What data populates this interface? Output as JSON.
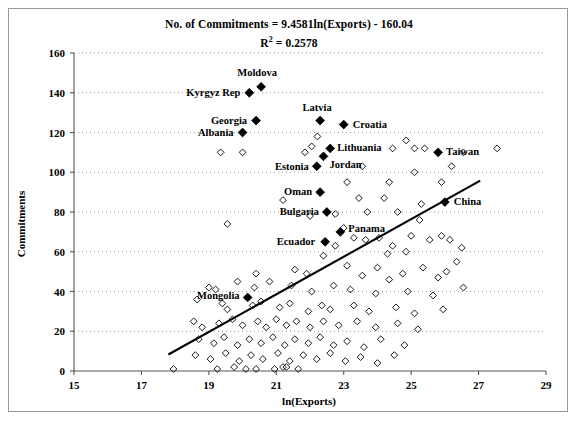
{
  "chart_data": {
    "type": "scatter",
    "title": "No. of Commitments = 9.4581ln(Exports) - 160.04",
    "subtitle_prefix": "R",
    "subtitle_sup": "2",
    "subtitle_rest": " = 0.2578",
    "xlabel": "ln(Exports)",
    "ylabel": "Commitments",
    "xlim": [
      15,
      29
    ],
    "ylim": [
      0,
      160
    ],
    "xticks": [
      15,
      17,
      19,
      21,
      23,
      25,
      27,
      29
    ],
    "yticks": [
      0,
      20,
      40,
      60,
      80,
      100,
      120,
      140,
      160
    ],
    "grid": "horizontal-dotted",
    "legend": "none",
    "regression": {
      "slope": 9.4581,
      "intercept": -160.04,
      "r_squared": 0.2578,
      "x_start": 17.8,
      "x_end": 27.05
    },
    "labeled_points": [
      {
        "label": "Moldova",
        "x": 20.55,
        "y": 143,
        "label_dx": -4,
        "label_dy": -11,
        "anchor": "middle"
      },
      {
        "label": "Kyrgyz Rep",
        "x": 20.2,
        "y": 140,
        "label_dx": -9,
        "label_dy": 3,
        "anchor": "end"
      },
      {
        "label": "Georgia",
        "x": 20.4,
        "y": 126,
        "label_dx": -9,
        "label_dy": 3,
        "anchor": "end"
      },
      {
        "label": "Latvia",
        "x": 22.3,
        "y": 126,
        "label_dx": -3,
        "label_dy": -10,
        "anchor": "middle"
      },
      {
        "label": "Croatia",
        "x": 23.0,
        "y": 124,
        "label_dx": 9,
        "label_dy": 3,
        "anchor": "start"
      },
      {
        "label": "Albania",
        "x": 20.0,
        "y": 120,
        "label_dx": -9,
        "label_dy": 3,
        "anchor": "end"
      },
      {
        "label": "Lithuania",
        "x": 22.6,
        "y": 112,
        "label_dx": 7,
        "label_dy": 3,
        "anchor": "start"
      },
      {
        "label": "Taiwan",
        "x": 25.8,
        "y": 110,
        "label_dx": 8,
        "label_dy": 3,
        "anchor": "start"
      },
      {
        "label": "Jordan",
        "x": 22.4,
        "y": 108,
        "label_dx": 6,
        "label_dy": 12,
        "anchor": "start"
      },
      {
        "label": "Estonia",
        "x": 22.2,
        "y": 103,
        "label_dx": -8,
        "label_dy": 4,
        "anchor": "end"
      },
      {
        "label": "Oman",
        "x": 22.3,
        "y": 90,
        "label_dx": -8,
        "label_dy": 3,
        "anchor": "end"
      },
      {
        "label": "China",
        "x": 26.0,
        "y": 85,
        "label_dx": 9,
        "label_dy": 3,
        "anchor": "start"
      },
      {
        "label": "Bulgaria",
        "x": 22.5,
        "y": 80,
        "label_dx": -8,
        "label_dy": 3,
        "anchor": "end"
      },
      {
        "label": "Panama",
        "x": 22.9,
        "y": 70,
        "label_dx": 8,
        "label_dy": 0,
        "anchor": "start"
      },
      {
        "label": "Ecuador",
        "x": 22.45,
        "y": 65,
        "label_dx": -10,
        "label_dy": 3,
        "anchor": "end"
      },
      {
        "label": "Mongolia",
        "x": 20.15,
        "y": 37,
        "label_dx": -8,
        "label_dy": 2,
        "anchor": "end"
      }
    ],
    "unlabeled_points": [
      {
        "x": 19.35,
        "y": 110
      },
      {
        "x": 20.0,
        "y": 110
      },
      {
        "x": 22.05,
        "y": 113
      },
      {
        "x": 22.22,
        "y": 118
      },
      {
        "x": 21.85,
        "y": 110
      },
      {
        "x": 23.55,
        "y": 103
      },
      {
        "x": 24.45,
        "y": 112
      },
      {
        "x": 24.85,
        "y": 116
      },
      {
        "x": 25.1,
        "y": 112
      },
      {
        "x": 25.4,
        "y": 112
      },
      {
        "x": 26.55,
        "y": 110
      },
      {
        "x": 27.55,
        "y": 112
      },
      {
        "x": 23.1,
        "y": 95
      },
      {
        "x": 24.35,
        "y": 95
      },
      {
        "x": 25.1,
        "y": 100
      },
      {
        "x": 25.9,
        "y": 95
      },
      {
        "x": 26.2,
        "y": 103
      },
      {
        "x": 21.2,
        "y": 86
      },
      {
        "x": 22.0,
        "y": 78
      },
      {
        "x": 23.45,
        "y": 87
      },
      {
        "x": 23.7,
        "y": 80
      },
      {
        "x": 24.2,
        "y": 87
      },
      {
        "x": 24.6,
        "y": 80
      },
      {
        "x": 25.3,
        "y": 84
      },
      {
        "x": 25.25,
        "y": 76
      },
      {
        "x": 19.55,
        "y": 74
      },
      {
        "x": 22.75,
        "y": 79
      },
      {
        "x": 23.0,
        "y": 72
      },
      {
        "x": 22.4,
        "y": 58
      },
      {
        "x": 22.75,
        "y": 63
      },
      {
        "x": 23.3,
        "y": 67
      },
      {
        "x": 23.65,
        "y": 66
      },
      {
        "x": 24.05,
        "y": 67
      },
      {
        "x": 24.45,
        "y": 63
      },
      {
        "x": 24.3,
        "y": 59
      },
      {
        "x": 24.85,
        "y": 60
      },
      {
        "x": 25.0,
        "y": 68
      },
      {
        "x": 25.55,
        "y": 66
      },
      {
        "x": 25.9,
        "y": 68
      },
      {
        "x": 26.15,
        "y": 66
      },
      {
        "x": 26.5,
        "y": 62
      },
      {
        "x": 26.35,
        "y": 55
      },
      {
        "x": 20.4,
        "y": 49
      },
      {
        "x": 21.55,
        "y": 51
      },
      {
        "x": 21.9,
        "y": 49
      },
      {
        "x": 23.1,
        "y": 53
      },
      {
        "x": 23.55,
        "y": 48
      },
      {
        "x": 24.0,
        "y": 52
      },
      {
        "x": 24.75,
        "y": 49
      },
      {
        "x": 25.35,
        "y": 52
      },
      {
        "x": 25.8,
        "y": 47
      },
      {
        "x": 26.05,
        "y": 50
      },
      {
        "x": 24.35,
        "y": 46
      },
      {
        "x": 19.0,
        "y": 42
      },
      {
        "x": 19.2,
        "y": 41
      },
      {
        "x": 19.85,
        "y": 45
      },
      {
        "x": 20.35,
        "y": 42
      },
      {
        "x": 20.8,
        "y": 45
      },
      {
        "x": 21.45,
        "y": 43
      },
      {
        "x": 22.05,
        "y": 40
      },
      {
        "x": 22.7,
        "y": 43
      },
      {
        "x": 23.2,
        "y": 41
      },
      {
        "x": 23.95,
        "y": 39
      },
      {
        "x": 24.9,
        "y": 40
      },
      {
        "x": 25.65,
        "y": 38
      },
      {
        "x": 26.55,
        "y": 42
      },
      {
        "x": 18.65,
        "y": 36
      },
      {
        "x": 19.4,
        "y": 34
      },
      {
        "x": 19.55,
        "y": 31
      },
      {
        "x": 20.3,
        "y": 33
      },
      {
        "x": 20.55,
        "y": 35
      },
      {
        "x": 21.1,
        "y": 32
      },
      {
        "x": 21.4,
        "y": 34
      },
      {
        "x": 21.95,
        "y": 30
      },
      {
        "x": 22.35,
        "y": 33
      },
      {
        "x": 22.6,
        "y": 31
      },
      {
        "x": 23.3,
        "y": 33
      },
      {
        "x": 23.75,
        "y": 30
      },
      {
        "x": 24.55,
        "y": 32
      },
      {
        "x": 25.1,
        "y": 29
      },
      {
        "x": 25.95,
        "y": 31
      },
      {
        "x": 18.55,
        "y": 25
      },
      {
        "x": 18.8,
        "y": 22
      },
      {
        "x": 19.3,
        "y": 24
      },
      {
        "x": 19.7,
        "y": 26
      },
      {
        "x": 20.0,
        "y": 23
      },
      {
        "x": 20.45,
        "y": 25
      },
      {
        "x": 20.7,
        "y": 22
      },
      {
        "x": 21.0,
        "y": 26
      },
      {
        "x": 21.3,
        "y": 23
      },
      {
        "x": 21.6,
        "y": 25
      },
      {
        "x": 22.0,
        "y": 22
      },
      {
        "x": 22.4,
        "y": 25
      },
      {
        "x": 22.85,
        "y": 23
      },
      {
        "x": 23.4,
        "y": 25
      },
      {
        "x": 23.95,
        "y": 22
      },
      {
        "x": 24.6,
        "y": 24
      },
      {
        "x": 25.2,
        "y": 21
      },
      {
        "x": 18.7,
        "y": 16
      },
      {
        "x": 19.15,
        "y": 14
      },
      {
        "x": 19.45,
        "y": 17
      },
      {
        "x": 19.85,
        "y": 13
      },
      {
        "x": 20.2,
        "y": 16
      },
      {
        "x": 20.55,
        "y": 14
      },
      {
        "x": 20.9,
        "y": 17
      },
      {
        "x": 21.25,
        "y": 13
      },
      {
        "x": 21.55,
        "y": 16
      },
      {
        "x": 21.95,
        "y": 14
      },
      {
        "x": 22.3,
        "y": 17
      },
      {
        "x": 22.7,
        "y": 13
      },
      {
        "x": 23.1,
        "y": 15
      },
      {
        "x": 23.6,
        "y": 12
      },
      {
        "x": 24.1,
        "y": 16
      },
      {
        "x": 24.8,
        "y": 13
      },
      {
        "x": 18.6,
        "y": 8
      },
      {
        "x": 19.05,
        "y": 6
      },
      {
        "x": 19.5,
        "y": 9
      },
      {
        "x": 19.9,
        "y": 5
      },
      {
        "x": 20.25,
        "y": 8
      },
      {
        "x": 20.6,
        "y": 6
      },
      {
        "x": 21.05,
        "y": 9
      },
      {
        "x": 21.4,
        "y": 5
      },
      {
        "x": 21.8,
        "y": 8
      },
      {
        "x": 22.2,
        "y": 6
      },
      {
        "x": 22.6,
        "y": 9
      },
      {
        "x": 23.05,
        "y": 5
      },
      {
        "x": 23.5,
        "y": 7
      },
      {
        "x": 24.0,
        "y": 4
      },
      {
        "x": 24.5,
        "y": 8
      },
      {
        "x": 17.95,
        "y": 1
      },
      {
        "x": 19.25,
        "y": 1
      },
      {
        "x": 19.75,
        "y": 2
      },
      {
        "x": 20.1,
        "y": 1
      },
      {
        "x": 20.4,
        "y": 1
      },
      {
        "x": 20.95,
        "y": 1
      },
      {
        "x": 21.2,
        "y": 2
      },
      {
        "x": 21.3,
        "y": 2
      },
      {
        "x": 21.65,
        "y": 1
      }
    ]
  },
  "colors": {
    "axis": "#555555",
    "grid": "#9a9a9a",
    "marker": "#000000",
    "frame": "#9a9a9a",
    "trendline": "#000000"
  }
}
